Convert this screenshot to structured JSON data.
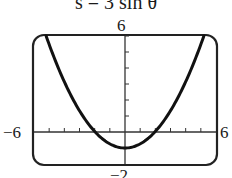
{
  "title": "s = 3 sin θ",
  "window": {
    "xmin_label": "−6",
    "xmax_label": "6",
    "ymax_label": "6",
    "ymin_label": "−2"
  },
  "chart_data": {
    "type": "line",
    "title": "s = 3 sin θ",
    "xlabel": "",
    "ylabel": "",
    "xlim": [
      -6,
      6
    ],
    "ylim": [
      -2,
      6
    ],
    "grid": false,
    "x_tick_step": 1,
    "y_tick_step": 1,
    "series": [
      {
        "name": "curve",
        "x": [
          -5.2,
          -4,
          -3,
          -2,
          -1,
          0,
          1,
          2,
          3,
          4,
          5.2
        ],
        "y": [
          6.0,
          3.15,
          1.33,
          0.04,
          -0.74,
          -1.0,
          -0.74,
          0.04,
          1.33,
          3.15,
          6.0
        ]
      }
    ],
    "colors": {
      "curve": "#111111",
      "frame": "#222222",
      "axes": "#333333"
    }
  }
}
